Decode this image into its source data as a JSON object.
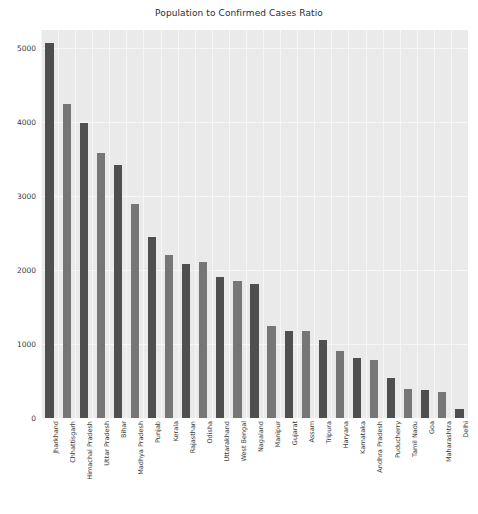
{
  "chart_data": {
    "type": "bar",
    "title": "Population to Confirmed Cases Ratio",
    "xlabel": "",
    "ylabel": "",
    "ylim": [
      0,
      5250
    ],
    "grid": true,
    "legend": null,
    "categories": [
      "Jharkhand",
      "Chhattisgarh",
      "Himachal Pradesh",
      "Uttar Pradesh",
      "Bihar",
      "Madhya Pradesh",
      "Punjab",
      "Kerala",
      "Rajasthan",
      "Odisha",
      "Uttarakhand",
      "West Bengal",
      "Nagaland",
      "Manipur",
      "Gujarat",
      "Assam",
      "Tripura",
      "Haryana",
      "Karnataka",
      "Andhra Pradesh",
      "Puducherry",
      "Tamil Nadu",
      "Goa",
      "Maharashtra",
      "Delhi"
    ],
    "values": [
      5080,
      4250,
      3990,
      3590,
      3420,
      2900,
      2450,
      2210,
      2090,
      2110,
      1910,
      1860,
      1820,
      1250,
      1180,
      1180,
      1050,
      910,
      810,
      780,
      540,
      390,
      380,
      350,
      120
    ],
    "yticks": [
      0,
      1000,
      2000,
      3000,
      4000,
      5000
    ],
    "ytick_labels": [
      "0",
      "1000",
      "2000",
      "3000",
      "4000",
      "5000"
    ],
    "bar_colors": [
      "#4f4f4f",
      "#767676"
    ],
    "plot_background": "#eaeaea",
    "grid_color": "#f6f6f6",
    "figure_background": "#ffffff"
  }
}
